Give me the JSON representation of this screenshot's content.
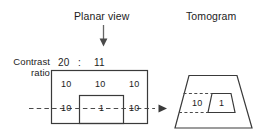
{
  "figure": {
    "headings": {
      "planar_view": "Planar view",
      "tomogram": "Tomogram"
    },
    "side_label": {
      "line1": "Contrast",
      "line2": "ratio"
    },
    "contrast_ratio": {
      "left_value": "20",
      "separator": ":",
      "right_value": "11"
    },
    "planar_view": {
      "top_row": [
        "10",
        "10",
        "10"
      ],
      "bottom_row": [
        "10",
        "1",
        "10"
      ]
    },
    "tomogram": {
      "background_value": "10",
      "lesion_value": "1"
    },
    "colors": {
      "stroke": "#3a3a3a",
      "text": "#1c1c1c",
      "arrow": "#555555",
      "background": "#ffffff"
    }
  }
}
